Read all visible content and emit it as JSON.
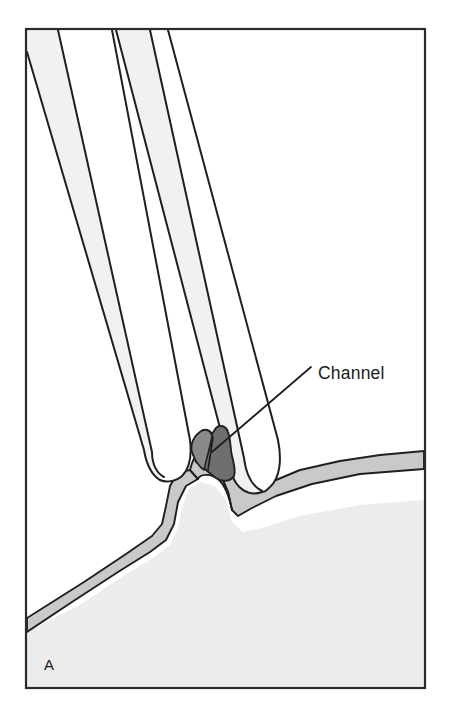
{
  "figure": {
    "panel_label": "A",
    "title_caption": "",
    "annotations": [
      {
        "name": "channel",
        "text": "Channel",
        "text_x": 318,
        "text_y": 374,
        "leader": {
          "x1": 311,
          "y1": 367,
          "x2": 212,
          "y2": 452
        }
      }
    ],
    "border": {
      "x": 26,
      "y": 29,
      "width": 399,
      "height": 659,
      "stroke": "#2b2b2b",
      "stroke_width": 2.2
    },
    "colors": {
      "background": "#ffffff",
      "outline": "#1f1f1f",
      "enamel_band": "#f1f1f1",
      "tooth_body": "#ffffff",
      "gingiva_band": "#c9c9c9",
      "soft_tissue": "#ececec",
      "channel_dark": "#6f6f6f",
      "channel_mid": "#8a8a8a",
      "label_text": "#1a1a1a"
    },
    "structures": [
      {
        "name": "left-tooth",
        "description": "left tooth crown descending diagonally from upper-left with enamel band"
      },
      {
        "name": "right-tooth",
        "description": "right tooth crown descending diagonally from top center with enamel band"
      },
      {
        "name": "gingiva",
        "description": "gingival tissue band sweeping across with interdental papilla peak"
      },
      {
        "name": "soft-tissue",
        "description": "underlying soft tissue fill below gingival band"
      },
      {
        "name": "channel-structure",
        "description": "dark shaded channel at the interdental junction between the two teeth"
      }
    ]
  }
}
